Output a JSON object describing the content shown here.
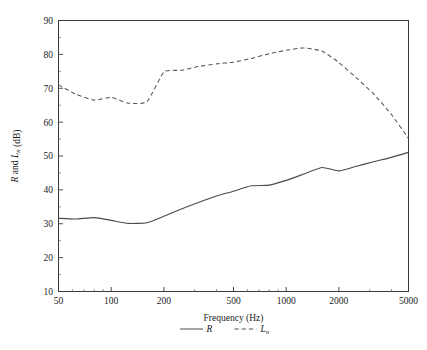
{
  "chart_data": {
    "type": "line",
    "title": "",
    "xlabel": "Frequency (Hz)",
    "ylabel": "R and Ln (dB)",
    "xscale": "log",
    "xlim": [
      50,
      5000
    ],
    "ylim": [
      10,
      90
    ],
    "grid": false,
    "legend_position": "below-axes",
    "xticks": [
      50,
      100,
      200,
      500,
      1000,
      2000,
      5000
    ],
    "xtick_labels": [
      "50",
      "100",
      "200",
      "500",
      "1000",
      "2000",
      "5000"
    ],
    "yticks": [
      10,
      20,
      30,
      40,
      50,
      60,
      70,
      80,
      90
    ],
    "ytick_labels": [
      "10",
      "20",
      "30",
      "40",
      "50",
      "60",
      "70",
      "80",
      "90"
    ],
    "x": [
      50,
      63,
      80,
      100,
      125,
      160,
      200,
      250,
      315,
      400,
      500,
      630,
      800,
      1000,
      1250,
      1600,
      2000,
      2500,
      3150,
      4000,
      5000
    ],
    "series": [
      {
        "name": "R",
        "style": "solid",
        "values": [
          31.6,
          31.4,
          31.8,
          31.0,
          30.1,
          30.3,
          32.2,
          34.3,
          36.3,
          38.2,
          39.6,
          41.2,
          41.4,
          42.8,
          44.6,
          46.6,
          45.6,
          46.9,
          48.3,
          49.6,
          51.1
        ]
      },
      {
        "name": "Ln",
        "style": "dashed",
        "values": [
          71.0,
          68.2,
          66.5,
          67.3,
          65.6,
          66.0,
          74.8,
          75.3,
          76.4,
          77.2,
          77.7,
          78.8,
          80.2,
          81.2,
          81.9,
          81.0,
          77.6,
          73.2,
          68.4,
          62.2,
          55.2
        ]
      }
    ],
    "legend": [
      {
        "label": "R",
        "sub": "",
        "style": "solid"
      },
      {
        "label": "L",
        "sub": "n",
        "style": "dashed"
      }
    ],
    "ylabel_parts": [
      {
        "text": "R",
        "italic": true,
        "sub": ""
      },
      {
        "text": " and ",
        "italic": false,
        "sub": ""
      },
      {
        "text": "L",
        "italic": true,
        "sub": "n"
      },
      {
        "text": " (dB)",
        "italic": false,
        "sub": ""
      }
    ],
    "colors": {
      "axis": "#3a3a3a",
      "series_R": "#4a4a4a",
      "series_Ln": "#55555a",
      "background": "#ffffff",
      "text": "#1a1a1a"
    }
  }
}
